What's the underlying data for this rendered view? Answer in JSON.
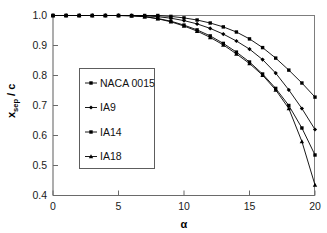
{
  "chart_data": {
    "type": "line",
    "title": "",
    "xlabel": "α",
    "ylabel": "x_sep / c",
    "ylabel_main": "x",
    "ylabel_sub": "sep",
    "ylabel_tail": "/ c",
    "xlim": [
      0,
      20
    ],
    "ylim": [
      0.4,
      1.0
    ],
    "xticks": [
      0,
      5,
      10,
      15,
      20
    ],
    "yticks": [
      0.4,
      0.5,
      0.6,
      0.7,
      0.8,
      0.9,
      1.0
    ],
    "xtick_labels": [
      "0",
      "5",
      "10",
      "15",
      "20"
    ],
    "ytick_labels": [
      "0.4",
      "0.5",
      "0.6",
      "0.7",
      "0.8",
      "0.9",
      "1.0"
    ],
    "grid": false,
    "legend_position": "center-left",
    "x": [
      0,
      1,
      2,
      3,
      4,
      5,
      6,
      7,
      8,
      9,
      10,
      11,
      12,
      13,
      14,
      15,
      16,
      17,
      18,
      19,
      20
    ],
    "series": [
      {
        "name": "NACA 0015",
        "marker": "square",
        "values": [
          1.0,
          1.0,
          1.0,
          1.0,
          1.0,
          1.0,
          1.0,
          1.0,
          1.0,
          0.997,
          0.992,
          0.985,
          0.975,
          0.962,
          0.945,
          0.922,
          0.893,
          0.858,
          0.818,
          0.775,
          0.728
        ]
      },
      {
        "name": "IA9",
        "marker": "diamond",
        "values": [
          1.0,
          1.0,
          1.0,
          1.0,
          1.0,
          1.0,
          1.0,
          0.999,
          0.996,
          0.991,
          0.983,
          0.972,
          0.957,
          0.938,
          0.915,
          0.888,
          0.853,
          0.808,
          0.752,
          0.69,
          0.62
        ]
      },
      {
        "name": "IA14",
        "marker": "square",
        "values": [
          1.0,
          1.0,
          1.0,
          1.0,
          1.0,
          1.0,
          0.999,
          0.996,
          0.99,
          0.981,
          0.968,
          0.952,
          0.932,
          0.907,
          0.878,
          0.845,
          0.805,
          0.757,
          0.7,
          0.625,
          0.535
        ]
      },
      {
        "name": "IA18",
        "marker": "triangle",
        "values": [
          1.0,
          1.0,
          1.0,
          1.0,
          1.0,
          1.0,
          0.999,
          0.996,
          0.989,
          0.979,
          0.965,
          0.948,
          0.927,
          0.902,
          0.872,
          0.84,
          0.801,
          0.752,
          0.69,
          0.58,
          0.435
        ]
      }
    ],
    "legend_entries": [
      {
        "label": "NACA 0015"
      },
      {
        "label": "IA9"
      },
      {
        "label": "IA14"
      },
      {
        "label": "IA18"
      }
    ],
    "colors": {
      "line": "#000000",
      "axis": "#6a6a6a",
      "text": "#111111",
      "background": "#ffffff"
    }
  }
}
